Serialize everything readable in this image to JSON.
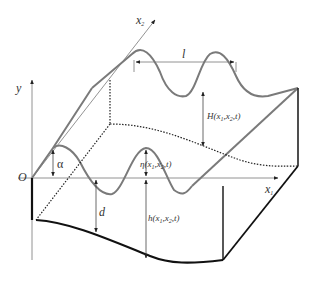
{
  "diagram": {
    "colors": {
      "surface_wave": "#7a7a7a",
      "bottom": "#1a1a1a",
      "axes": "#555555",
      "dotted": "#222222",
      "text": "#333333",
      "background": "#ffffff"
    },
    "axes": {
      "y": "y",
      "x1": "x",
      "x1_sub": "1",
      "x2": "x",
      "x2_sub": "2",
      "origin": "O"
    },
    "labels": {
      "wavelength": "l",
      "angle": "α",
      "depth": "d",
      "H": "H(x",
      "H_sub1": "1",
      "H_mid": ",x",
      "H_sub2": "2",
      "H_end": ",t)",
      "eta": "η(x",
      "eta_sub1": "1",
      "eta_mid": ",x",
      "eta_sub2": "2",
      "eta_end": ",t)",
      "h": "h(x",
      "h_sub1": "1",
      "h_mid": ",x",
      "h_sub2": "2",
      "h_end": ",t)"
    }
  }
}
